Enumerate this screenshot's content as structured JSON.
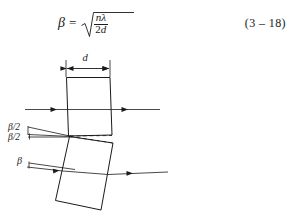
{
  "equation": {
    "lhs": "β",
    "equals": "=",
    "numerator": "nλ",
    "denominator_coefficient": "2",
    "denominator_symbol": "d",
    "full_text": "β = √(nλ / 2d)",
    "number": "(3 – 18)"
  },
  "figure": {
    "labels": {
      "thickness": "d",
      "half_angle_upper": "β/2",
      "half_angle_lower": "β/2",
      "full_angle": "β"
    },
    "icons": {
      "dimension_arrow": "dimension-arrow-icon",
      "ray_arrow": "ray-arrow-icon"
    },
    "colors": {
      "line": "#1a1a1a",
      "background": "#ffffff"
    },
    "elements": {
      "upper_block": "upper-crystal-block",
      "lower_block": "lower-tilted-crystal-block",
      "incident_ray_upper": "incident-ray-upper",
      "transmitted_ray_upper": "transmitted-ray-upper",
      "incident_ray_lower": "incident-ray-lower",
      "transmitted_ray_lower": "transmitted-ray-lower",
      "reference_dashed_line": "reference-dashed-line"
    }
  }
}
